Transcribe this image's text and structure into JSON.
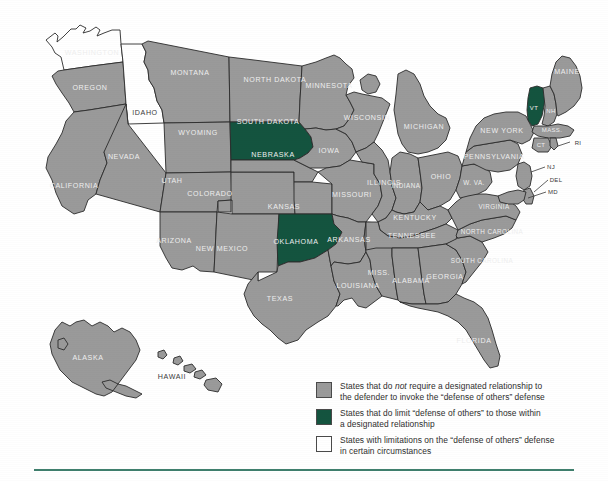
{
  "map": {
    "title": "United States map — defense of others designated relationship",
    "colors": {
      "gray": "#9a9a9a",
      "green": "#14543f",
      "white": "#ffffff",
      "outline": "#2b2b2b",
      "rule": "#3f7f6d",
      "label_light": "#efefef",
      "label_dark": "#3a3a3a"
    },
    "states": [
      {
        "code": "WA",
        "label": "WASHINGTON",
        "category": "white"
      },
      {
        "code": "OR",
        "label": "OREGON",
        "category": "gray"
      },
      {
        "code": "ID",
        "label": "IDAHO",
        "category": "white"
      },
      {
        "code": "MT",
        "label": "MONTANA",
        "category": "gray"
      },
      {
        "code": "WY",
        "label": "WYOMING",
        "category": "gray"
      },
      {
        "code": "CA",
        "label": "CALIFORNIA",
        "category": "gray"
      },
      {
        "code": "NV",
        "label": "NEVADA",
        "category": "gray"
      },
      {
        "code": "UT",
        "label": "UTAH",
        "category": "gray"
      },
      {
        "code": "CO",
        "label": "COLORADO",
        "category": "gray"
      },
      {
        "code": "AZ",
        "label": "ARIZONA",
        "category": "gray"
      },
      {
        "code": "NM",
        "label": "NEW MEXICO",
        "category": "gray"
      },
      {
        "code": "ND",
        "label": "NORTH DAKOTA",
        "category": "gray"
      },
      {
        "code": "SD",
        "label": "SOUTH DAKOTA",
        "category": "green"
      },
      {
        "code": "NE",
        "label": "NEBRASKA",
        "category": "gray"
      },
      {
        "code": "KS",
        "label": "KANSAS",
        "category": "gray"
      },
      {
        "code": "OK",
        "label": "OKLAHOMA",
        "category": "green"
      },
      {
        "code": "TX",
        "label": "TEXAS",
        "category": "gray"
      },
      {
        "code": "MN",
        "label": "MINNESOTA",
        "category": "gray"
      },
      {
        "code": "IA",
        "label": "IOWA",
        "category": "gray"
      },
      {
        "code": "MO",
        "label": "MISSOURI",
        "category": "gray"
      },
      {
        "code": "AR",
        "label": "ARKANSAS",
        "category": "gray"
      },
      {
        "code": "LA",
        "label": "LOUISIANA",
        "category": "gray"
      },
      {
        "code": "WI",
        "label": "WISCONSIN",
        "category": "gray"
      },
      {
        "code": "IL",
        "label": "ILLINOIS",
        "category": "gray"
      },
      {
        "code": "MS",
        "label": "MISS.",
        "category": "gray"
      },
      {
        "code": "MI",
        "label": "MICHIGAN",
        "category": "gray"
      },
      {
        "code": "IN",
        "label": "INDIANA",
        "category": "gray"
      },
      {
        "code": "OH",
        "label": "OHIO",
        "category": "gray"
      },
      {
        "code": "KY",
        "label": "KENTUCKY",
        "category": "gray"
      },
      {
        "code": "TN",
        "label": "TENNESSEE",
        "category": "gray"
      },
      {
        "code": "AL",
        "label": "ALABAMA",
        "category": "gray"
      },
      {
        "code": "GA",
        "label": "GEORGIA",
        "category": "gray"
      },
      {
        "code": "FL",
        "label": "FLORIDA",
        "category": "gray"
      },
      {
        "code": "SC",
        "label": "SOUTH CAROLINA",
        "category": "gray"
      },
      {
        "code": "NC",
        "label": "NORTH CAROLINA",
        "category": "gray"
      },
      {
        "code": "VA",
        "label": "VIRGINIA",
        "category": "gray"
      },
      {
        "code": "WV",
        "label": "W. VA.",
        "category": "gray"
      },
      {
        "code": "PA",
        "label": "PENNSYLVANIA",
        "category": "gray"
      },
      {
        "code": "NY",
        "label": "NEW YORK",
        "category": "gray"
      },
      {
        "code": "VT",
        "label": "VT",
        "category": "green"
      },
      {
        "code": "NH",
        "label": "NH",
        "category": "gray"
      },
      {
        "code": "ME",
        "label": "MAINE",
        "category": "gray"
      },
      {
        "code": "MA",
        "label": "MASS.",
        "category": "gray"
      },
      {
        "code": "CT",
        "label": "CT",
        "category": "gray"
      },
      {
        "code": "RI",
        "label": "RI",
        "category": "gray"
      },
      {
        "code": "NJ",
        "label": "NJ",
        "category": "gray"
      },
      {
        "code": "DE",
        "label": "DEL",
        "category": "gray"
      },
      {
        "code": "MD",
        "label": "MD",
        "category": "gray"
      },
      {
        "code": "AK",
        "label": "ALASKA",
        "category": "gray"
      },
      {
        "code": "HI",
        "label": "HAWAII",
        "category": "gray"
      }
    ]
  },
  "legend": {
    "items": [
      {
        "swatch": "gray",
        "line1_a": "States that do ",
        "line1_em": "not",
        "line1_b": " require a designated relationship to",
        "line2": "the defender to invoke the “defense of others” defense"
      },
      {
        "swatch": "green",
        "line1_a": "States that do limit “defense of others” to those within",
        "line1_em": "",
        "line1_b": "",
        "line2": "a designated relationship"
      },
      {
        "swatch": "white",
        "line1_a": "States with limitations on the “defense of others” defense",
        "line1_em": "",
        "line1_b": "",
        "line2": "in certain circumstances"
      }
    ]
  }
}
